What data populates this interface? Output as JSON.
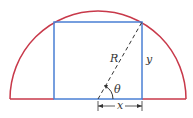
{
  "diagram": {
    "labels": {
      "radius": "R",
      "height": "y",
      "half_width": "x",
      "angle": "θ"
    },
    "colors": {
      "semicircle": "#c8394a",
      "rectangle": "#4a7fd4",
      "dashed_radius": "#333333",
      "dimension": "#333333"
    },
    "geometry": {
      "center": [
        98,
        99
      ],
      "radius": 88,
      "rect": {
        "x_left": 54,
        "x_right": 142,
        "y_top": 22,
        "y_bottom": 99
      }
    }
  }
}
